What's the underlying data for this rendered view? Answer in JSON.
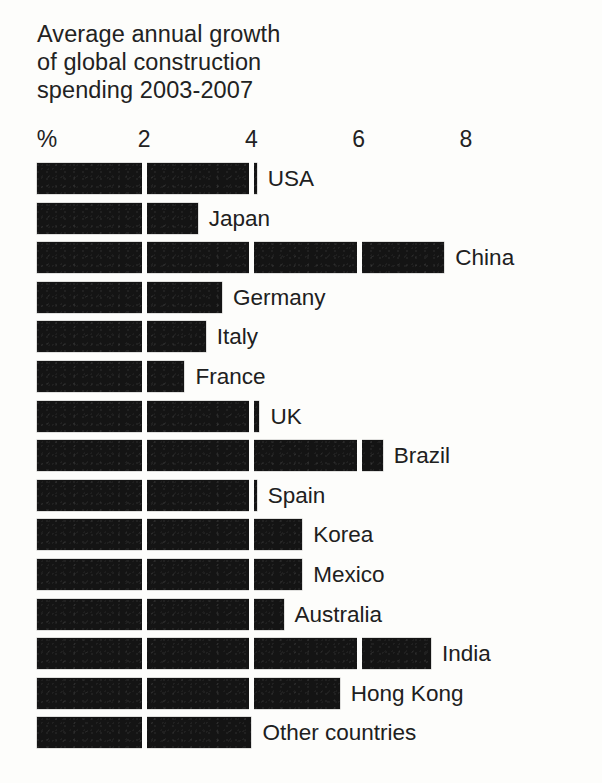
{
  "chart_data": {
    "type": "bar",
    "orientation": "horizontal",
    "title": "Average annual growth\nof global construction\nspending 2003-2007",
    "title_lines": [
      "Average annual growth",
      "of global construction",
      "spending 2003-2007"
    ],
    "xlabel": "%",
    "ylabel": "",
    "xlim": [
      0,
      9
    ],
    "grid": true,
    "grid_axis": "x",
    "legend": false,
    "axis_position": "top",
    "unit": "%",
    "axis_unit_label": "%",
    "tick_labels": [
      "%",
      "2",
      "4",
      "6",
      "8"
    ],
    "tick_values": [
      0,
      2,
      4,
      6,
      8
    ],
    "categories": [
      "USA",
      "Japan",
      "China",
      "Germany",
      "Italy",
      "France",
      "UK",
      "Brazil",
      "Spain",
      "Korea",
      "Mexico",
      "Australia",
      "India",
      "Hong Kong",
      "Other countries"
    ],
    "values": [
      4.1,
      3.0,
      7.6,
      3.45,
      3.15,
      2.75,
      4.15,
      6.45,
      4.1,
      4.95,
      4.95,
      4.6,
      7.35,
      5.65,
      4.0
    ],
    "bars": [
      {
        "label": "USA",
        "value": 4.1
      },
      {
        "label": "Japan",
        "value": 3.0
      },
      {
        "label": "China",
        "value": 7.6
      },
      {
        "label": "Germany",
        "value": 3.45
      },
      {
        "label": "Italy",
        "value": 3.15
      },
      {
        "label": "France",
        "value": 2.75
      },
      {
        "label": "UK",
        "value": 4.15
      },
      {
        "label": "Brazil",
        "value": 6.45
      },
      {
        "label": "Spain",
        "value": 4.1
      },
      {
        "label": "Korea",
        "value": 4.95
      },
      {
        "label": "Mexico",
        "value": 4.95
      },
      {
        "label": "Australia",
        "value": 4.6
      },
      {
        "label": "India",
        "value": 7.35
      },
      {
        "label": "Hong Kong",
        "value": 5.65
      },
      {
        "label": "Other countries",
        "value": 4.0
      }
    ],
    "colors": {
      "bar": "#141414",
      "background": "#fdfdfb",
      "text": "#202020",
      "gridline": "#fdfdfb"
    }
  }
}
